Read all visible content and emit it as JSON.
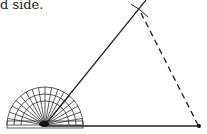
{
  "caption": "d side.",
  "diagram": {
    "type": "geometric-construction",
    "vertex": [
      45,
      125
    ],
    "baseline_end": [
      199,
      126
    ],
    "ray_end": [
      146,
      0
    ],
    "apex": [
      139,
      10
    ],
    "protractor": {
      "center": [
        45,
        125
      ],
      "outer_radius": 38,
      "mid_radius": 31,
      "inner_radius": 24,
      "tick_step_deg": 10
    },
    "colors": {
      "line": "#222222",
      "background": "#ffffff"
    }
  }
}
